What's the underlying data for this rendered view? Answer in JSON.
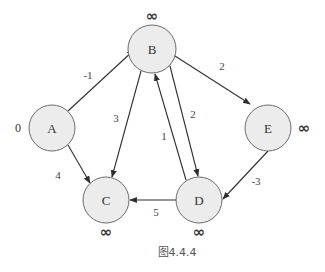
{
  "diagram": {
    "type": "directed-weighted-graph",
    "caption": "图4.4.4",
    "nodes": [
      {
        "id": "A",
        "label": "A",
        "distance": "0",
        "cx": 52,
        "cy": 128,
        "r": 23,
        "dist_x": 18,
        "dist_y": 128
      },
      {
        "id": "B",
        "label": "B",
        "distance": "∞",
        "cx": 152,
        "cy": 49,
        "r": 24,
        "dist_x": 152,
        "dist_y": 16
      },
      {
        "id": "C",
        "label": "C",
        "distance": "∞",
        "cx": 106,
        "cy": 200,
        "r": 23,
        "dist_x": 106,
        "dist_y": 232
      },
      {
        "id": "D",
        "label": "D",
        "distance": "∞",
        "cx": 199,
        "cy": 200,
        "r": 23,
        "dist_x": 199,
        "dist_y": 232
      },
      {
        "id": "E",
        "label": "E",
        "distance": "∞",
        "cx": 268,
        "cy": 128,
        "r": 23,
        "dist_x": 304,
        "dist_y": 128
      }
    ],
    "edges": [
      {
        "from": "A",
        "to": "B",
        "weight": "-1",
        "x1": 68,
        "y1": 111,
        "x2": 134,
        "y2": 50,
        "lx": 88,
        "ly": 75
      },
      {
        "from": "A",
        "to": "C",
        "weight": "4",
        "x1": 68,
        "y1": 145,
        "x2": 90,
        "y2": 183,
        "lx": 58,
        "ly": 175
      },
      {
        "from": "B",
        "to": "C",
        "weight": "3",
        "x1": 141,
        "y1": 71,
        "x2": 112,
        "y2": 177,
        "lx": 116,
        "ly": 118
      },
      {
        "from": "B",
        "to": "E",
        "weight": "2",
        "x1": 175,
        "y1": 56,
        "x2": 250,
        "y2": 104,
        "lx": 222,
        "ly": 66
      },
      {
        "from": "B",
        "to": "D",
        "weight": "2",
        "x1": 170,
        "y1": 66,
        "x2": 198,
        "y2": 176,
        "lx": 193,
        "ly": 114
      },
      {
        "from": "D",
        "to": "B",
        "weight": "1",
        "x1": 186,
        "y1": 180,
        "x2": 155,
        "y2": 74,
        "lx": 164,
        "ly": 136
      },
      {
        "from": "D",
        "to": "C",
        "weight": "5",
        "x1": 176,
        "y1": 200,
        "x2": 130,
        "y2": 200,
        "lx": 156,
        "ly": 212
      },
      {
        "from": "E",
        "to": "D",
        "weight": "-3",
        "x1": 268,
        "y1": 151,
        "x2": 223,
        "y2": 199,
        "lx": 256,
        "ly": 181
      }
    ]
  },
  "colors": {
    "node_fill": "#ececec",
    "node_stroke": "#6a6a6a",
    "edge": "#2f2f2f",
    "text": "#333333"
  }
}
